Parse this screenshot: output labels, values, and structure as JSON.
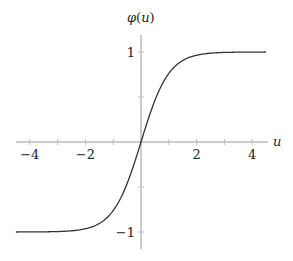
{
  "chart_data": {
    "type": "line",
    "title": "",
    "xlabel": "u",
    "ylabel": "φ(u)",
    "function": "tanh(u)",
    "xlim": [
      -4.5,
      4.5
    ],
    "ylim": [
      -1.2,
      1.2
    ],
    "x_ticks": [
      -4,
      -3,
      -2,
      -1,
      0,
      1,
      2,
      3,
      4
    ],
    "x_tick_labels": [
      "−4",
      "−2",
      "2",
      "4"
    ],
    "x_tick_label_values": [
      -4,
      -2,
      2,
      4
    ],
    "y_ticks": [
      -1,
      -0.5,
      0.5,
      1
    ],
    "y_tick_labels": [
      "−1",
      "1"
    ],
    "y_tick_label_values": [
      -1,
      1
    ],
    "grid": false,
    "legend": null,
    "series": [
      {
        "name": "φ(u)",
        "color": "#333333",
        "x": [
          -4.5,
          -4,
          -3,
          -2,
          -1.5,
          -1,
          -0.5,
          0,
          0.5,
          1,
          1.5,
          2,
          3,
          4,
          4.5
        ],
        "y": [
          -1.0,
          -0.999,
          -0.995,
          -0.964,
          -0.905,
          -0.762,
          -0.462,
          0,
          0.462,
          0.762,
          0.905,
          0.964,
          0.995,
          0.999,
          1.0
        ]
      }
    ]
  },
  "axes": {
    "x_label": "u",
    "y_label": "φ(u)",
    "axis_color": "#9a9a9a",
    "curve_color": "#333333"
  }
}
